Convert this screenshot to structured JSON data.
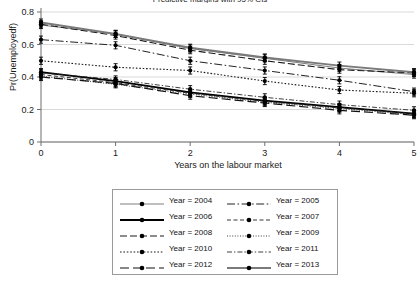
{
  "chart_data": {
    "type": "line",
    "title": "Predictive margins with 95% CIs",
    "xlabel": "Years on the labour market",
    "ylabel": "Pr(Unemployedf)",
    "x": [
      0,
      1,
      2,
      3,
      4,
      5
    ],
    "xtick_labels": [
      "0",
      "1",
      "2",
      "3",
      "4",
      "5"
    ],
    "ytick_labels": [
      "0",
      "0.2",
      "0.4",
      "0.6",
      "0.8"
    ],
    "ytick_values": [
      0,
      0.2,
      0.4,
      0.6,
      0.8
    ],
    "xlim": [
      0,
      5
    ],
    "ylim": [
      0,
      0.8
    ],
    "grid": "horizontal",
    "legend_position": "below",
    "error_bars": "95% CI",
    "series": [
      {
        "name": "Year = 2004",
        "style": "thin-solid",
        "color": "#6f6f6f",
        "width": 0.9,
        "values": [
          0.72,
          0.665,
          0.575,
          0.515,
          0.455,
          0.415
        ]
      },
      {
        "name": "Year = 2005",
        "style": "dash-dot",
        "color": "#222222",
        "width": 1.0,
        "values": [
          0.63,
          0.595,
          0.5,
          0.44,
          0.38,
          0.31
        ]
      },
      {
        "name": "Year = 2006",
        "style": "thick-solid",
        "color": "#000000",
        "width": 1.8,
        "values": [
          0.43,
          0.375,
          0.305,
          0.255,
          0.215,
          0.175
        ]
      },
      {
        "name": "Year = 2007",
        "style": "dashed-fine",
        "color": "#222222",
        "width": 0.9,
        "values": [
          0.415,
          0.365,
          0.3,
          0.25,
          0.21,
          0.175
        ]
      },
      {
        "name": "Year = 2008",
        "style": "dashed",
        "color": "#1a1a1a",
        "width": 1.1,
        "values": [
          0.725,
          0.655,
          0.565,
          0.5,
          0.445,
          0.425
        ]
      },
      {
        "name": "Year = 2009",
        "style": "dotted-fine",
        "color": "#2a2a2a",
        "width": 0.9,
        "values": [
          0.405,
          0.355,
          0.295,
          0.245,
          0.205,
          0.17
        ]
      },
      {
        "name": "Year = 2010",
        "style": "dotted",
        "color": "#1a1a1a",
        "width": 1.1,
        "values": [
          0.5,
          0.46,
          0.44,
          0.375,
          0.32,
          0.3
        ]
      },
      {
        "name": "Year = 2011",
        "style": "dash-dot-fine",
        "color": "#2a2a2a",
        "width": 0.9,
        "values": [
          0.425,
          0.385,
          0.325,
          0.275,
          0.23,
          0.195
        ]
      },
      {
        "name": "Year = 2012",
        "style": "long-dash",
        "color": "#111111",
        "width": 1.2,
        "values": [
          0.4,
          0.36,
          0.285,
          0.24,
          0.195,
          0.165
        ]
      },
      {
        "name": "Year = 2013",
        "style": "thick-gray-solid",
        "color": "#7a7a7a",
        "width": 2.0,
        "values": [
          0.735,
          0.665,
          0.58,
          0.52,
          0.47,
          0.43
        ]
      }
    ]
  },
  "legend": {
    "entries": [
      {
        "label": "Year = 2004",
        "col": 0,
        "row": 0
      },
      {
        "label": "Year = 2005",
        "col": 1,
        "row": 0
      },
      {
        "label": "Year = 2006",
        "col": 0,
        "row": 1
      },
      {
        "label": "Year = 2007",
        "col": 1,
        "row": 1
      },
      {
        "label": "Year = 2008",
        "col": 0,
        "row": 2
      },
      {
        "label": "Year = 2009",
        "col": 1,
        "row": 2
      },
      {
        "label": "Year = 2010",
        "col": 0,
        "row": 3
      },
      {
        "label": "Year = 2011",
        "col": 1,
        "row": 3
      },
      {
        "label": "Year = 2012",
        "col": 0,
        "row": 4
      },
      {
        "label": "Year = 2013",
        "col": 1,
        "row": 4
      }
    ]
  },
  "colors": {
    "gridline": "#cfcfcf",
    "axis": "#6e6e6e",
    "marker": "#000000",
    "legend_border": "#9a9a9a"
  }
}
